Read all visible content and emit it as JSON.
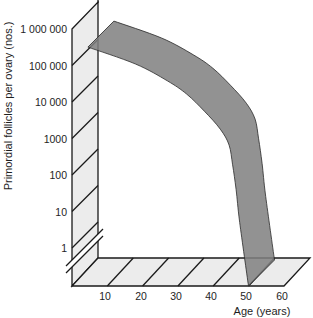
{
  "chart_data": {
    "type": "line",
    "style": "3D ribbon on pseudo-3D axes",
    "title": "",
    "xlabel": "Age (years)",
    "ylabel": "Primordial follicles per ovary (nos.)",
    "x_ticks": [
      "10",
      "20",
      "30",
      "40",
      "50",
      "60"
    ],
    "y_ticks": [
      "1 000 000",
      "100 000",
      "10 000",
      "1000",
      "100",
      "10",
      "1"
    ],
    "y_scale": "log",
    "y_axis_break": "between 1 and 0",
    "xlim": [
      0,
      60
    ],
    "ylim": [
      0,
      1000000
    ],
    "grid": false,
    "legend": null,
    "series": [
      {
        "name": "Primordial follicles per ovary",
        "x": [
          4.5,
          18,
          27,
          32.5,
          37.5,
          42,
          44.5,
          45.5,
          46.5,
          47.5,
          50
        ],
        "values": [
          320000,
          110000,
          38000,
          16500,
          5600,
          1800,
          660,
          190,
          40,
          5,
          0
        ],
        "color": "#808080"
      }
    ]
  },
  "colors": {
    "band": "#8f8f8f",
    "panel_fill": "#ececec",
    "lines": "#1a1a1a",
    "text": "#1e1e1e"
  }
}
